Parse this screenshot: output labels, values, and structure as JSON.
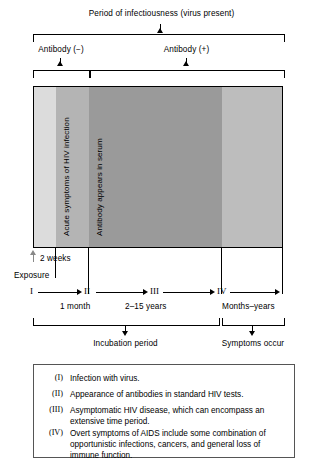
{
  "title": "Period of infectiousness (virus present)",
  "brackets": {
    "antibody_neg": "Antibody (−)",
    "antibody_pos": "Antibody (+)",
    "incubation": "Incubation period",
    "symptoms": "Symptoms occur"
  },
  "bar_labels": {
    "acute": "Acute symptoms of HIV infection",
    "seroconversion": "Antibody appears in serum"
  },
  "timeline": {
    "exposure": "Exposure",
    "two_weeks": "2 weeks",
    "stages": [
      {
        "roman": "I",
        "duration": ""
      },
      {
        "roman": "II",
        "duration": "1 month"
      },
      {
        "roman": "III",
        "duration": "2–15 years"
      },
      {
        "roman": "IV",
        "duration": "Months–years"
      }
    ]
  },
  "legend": [
    {
      "num": "(I)",
      "text": "Infection with virus."
    },
    {
      "num": "(II)",
      "text": "Appearance of antibodies in standard HIV tests."
    },
    {
      "num": "(III)",
      "text": "Asymptomatic HIV disease, which can encompass an extensive time period."
    },
    {
      "num": "(IV)",
      "text": "Overt symptoms of AIDS include some combination of opportunistic infections, cancers, and general loss of immune function."
    }
  ],
  "colors": {
    "band_light": "#dcdcdc",
    "band_mid": "#b4b4b4",
    "band_dark": "#9a9a9a",
    "band_tail": "#bdbdbd",
    "line": "#000000",
    "legend_border": "#555555"
  }
}
